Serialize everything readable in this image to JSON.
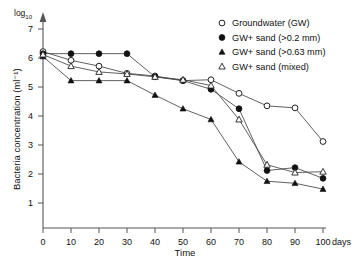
{
  "chart_data": {
    "type": "line",
    "title": "",
    "xlabel": "Time",
    "xunit": "days",
    "ylabel": "Bacteria concentration (ml⁻¹)",
    "yscale_label": "log₁₀",
    "xlim": [
      0,
      100
    ],
    "ylim": [
      0,
      7.3
    ],
    "xticks": [
      0,
      10,
      20,
      30,
      40,
      50,
      60,
      70,
      80,
      90,
      100
    ],
    "xticklabels": [
      "0",
      "10",
      "20",
      "30",
      "40",
      "50",
      "60",
      "70",
      "80",
      "90",
      "100"
    ],
    "yticks": [
      1,
      2,
      3,
      4,
      5,
      6,
      7
    ],
    "yticklabels": [
      "1",
      "2",
      "3",
      "4",
      "5",
      "6",
      "7"
    ],
    "grid": false,
    "legend_position": "top-right",
    "x": [
      0,
      10,
      20,
      30,
      40,
      50,
      60,
      70,
      80,
      90,
      100
    ],
    "series": [
      {
        "name": "Groundwater (GW)",
        "marker": "open-circle",
        "values": [
          6.22,
          5.92,
          5.72,
          5.47,
          5.38,
          5.22,
          5.25,
          4.78,
          4.35,
          4.28,
          3.12
        ]
      },
      {
        "name": "GW+ sand (>0.2 mm)",
        "marker": "filled-circle",
        "values": [
          6.15,
          6.15,
          6.15,
          6.15,
          5.35,
          5.22,
          4.92,
          4.25,
          2.12,
          2.22,
          1.85
        ]
      },
      {
        "name": "GW+ sand (>0.63 mm)",
        "marker": "filled-triangle",
        "values": [
          6.05,
          5.22,
          5.22,
          5.22,
          4.72,
          4.25,
          3.88,
          2.42,
          1.75,
          1.68,
          1.48
        ]
      },
      {
        "name": "GW+ sand (mixed)",
        "marker": "open-triangle",
        "values": [
          6.12,
          5.72,
          5.52,
          5.45,
          5.35,
          5.25,
          5.05,
          3.88,
          2.32,
          2.05,
          2.08
        ]
      }
    ]
  },
  "legend": {
    "items": [
      {
        "label": "Groundwater (GW)",
        "marker": "open-circle"
      },
      {
        "label": "GW+ sand (>0.2 mm)",
        "marker": "filled-circle"
      },
      {
        "label": "GW+ sand (>0.63 mm)",
        "marker": "filled-triangle"
      },
      {
        "label": "GW+ sand (mixed)",
        "marker": "open-triangle"
      }
    ]
  },
  "axes": {
    "y_title": "Bacteria concentration (ml⁻¹)",
    "x_title": "Time",
    "x_unit_label": "days",
    "log_label": "log",
    "log_sub": "10"
  }
}
